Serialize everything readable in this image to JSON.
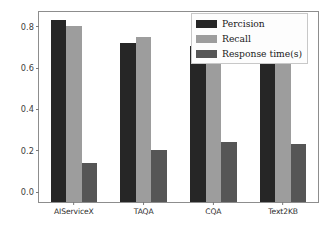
{
  "chart_data": {
    "type": "bar",
    "title": "",
    "xlabel": "",
    "ylabel": "",
    "categories": [
      "AIServiceX",
      "TAQA",
      "CQA",
      "Text2KB"
    ],
    "series": [
      {
        "name": "Percision",
        "color": "#262626",
        "values": [
          0.88,
          0.77,
          0.755,
          0.7
        ]
      },
      {
        "name": "Recall",
        "color": "#9d9d9d",
        "values": [
          0.85,
          0.8,
          0.7,
          0.7
        ]
      },
      {
        "name": "Response time(s)",
        "color": "#565656",
        "values": [
          0.19,
          0.25,
          0.29,
          0.28
        ]
      }
    ],
    "ylim": [
      0.0,
      0.92
    ],
    "yticks": [
      "0.0",
      "0.2",
      "0.4",
      "0.6",
      "0.8"
    ],
    "ytick_values": [
      0.0,
      0.2,
      0.4,
      0.6,
      0.8
    ],
    "grid": false,
    "legend_position": "upper right"
  },
  "caption": {
    "text": ""
  }
}
